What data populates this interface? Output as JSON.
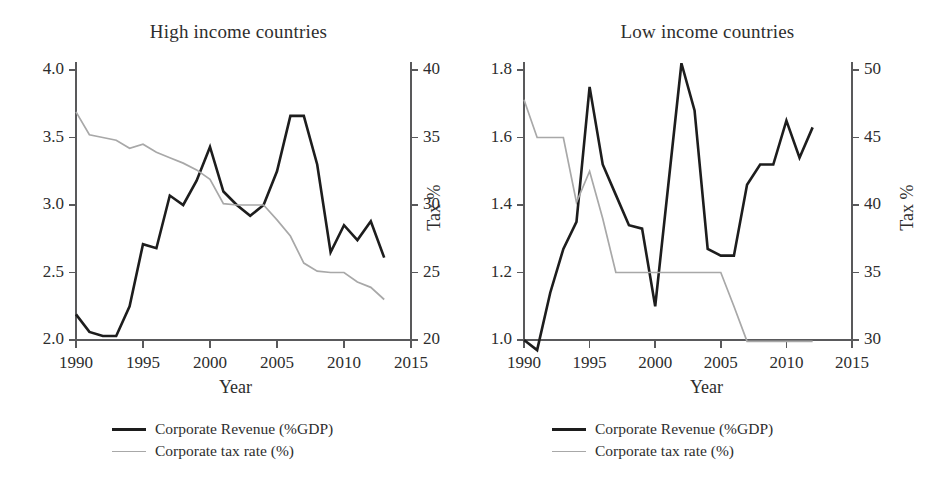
{
  "figure": {
    "panel_count": 2,
    "background_color": "#ffffff",
    "revenue_color": "#1d1d1d",
    "tax_color": "#a8a8a8",
    "axis_color": "#59595b"
  },
  "legend": {
    "revenue_label": "Corporate Revenue (%GDP)",
    "tax_label": "Corporate tax rate (%)"
  },
  "labels": {
    "xlabel": "Year",
    "ylabel_right": "Tax %"
  },
  "chart_data": [
    {
      "type": "line",
      "title": "High income countries",
      "xlabel": "Year",
      "ylabel": "",
      "ylabel_secondary": "Tax %",
      "grid": false,
      "legend_position": "below",
      "xlim": [
        1990,
        2015
      ],
      "xticks": [
        1990,
        1995,
        2000,
        2005,
        2010,
        2015
      ],
      "xtick_labels": [
        "1990",
        "1995",
        "2000",
        "2005",
        "2010",
        "2015"
      ],
      "ylim": [
        2.0,
        4.0
      ],
      "yticks": [
        2.0,
        2.5,
        3.0,
        3.5,
        4.0
      ],
      "ytick_labels": [
        "2.0",
        "2.5",
        "3.0",
        "3.5",
        "4.0"
      ],
      "ylim_secondary": [
        20,
        40
      ],
      "yticks_secondary": [
        20,
        25,
        30,
        35,
        40
      ],
      "ytick_labels_secondary": [
        "20",
        "25",
        "30",
        "35",
        "40"
      ],
      "series": [
        {
          "name": "Corporate Revenue (%GDP)",
          "axis": "left",
          "color": "#1d1d1d",
          "x": [
            1990,
            1991,
            1992,
            1993,
            1994,
            1995,
            1996,
            1997,
            1998,
            1999,
            2000,
            2001,
            2002,
            2003,
            2004,
            2005,
            2006,
            2007,
            2008,
            2009,
            2010,
            2011,
            2012,
            2013
          ],
          "values": [
            2.19,
            2.06,
            2.03,
            2.03,
            2.25,
            2.71,
            2.68,
            3.07,
            3.0,
            3.18,
            3.43,
            3.1,
            3.0,
            2.92,
            3.0,
            3.25,
            3.66,
            3.66,
            3.3,
            2.65,
            2.85,
            2.74,
            2.88,
            2.61
          ]
        },
        {
          "name": "Corporate tax rate (%)",
          "axis": "right",
          "color": "#a8a8a8",
          "x": [
            1990,
            1991,
            1992,
            1993,
            1994,
            1995,
            1996,
            1997,
            1998,
            1999,
            2000,
            2001,
            2002,
            2003,
            2004,
            2005,
            2006,
            2007,
            2008,
            2009,
            2010,
            2011,
            2012,
            2013
          ],
          "values": [
            36.9,
            35.2,
            35.0,
            34.8,
            34.2,
            34.5,
            33.9,
            33.5,
            33.1,
            32.6,
            31.9,
            30.1,
            30.0,
            30.0,
            30.0,
            28.9,
            27.7,
            25.7,
            25.1,
            25.0,
            25.0,
            24.3,
            23.9,
            23.0
          ]
        }
      ]
    },
    {
      "type": "line",
      "title": "Low income countries",
      "xlabel": "Year",
      "ylabel": "",
      "ylabel_secondary": "Tax %",
      "grid": false,
      "legend_position": "below",
      "xlim": [
        1990,
        2015
      ],
      "xticks": [
        1990,
        1995,
        2000,
        2005,
        2010,
        2015
      ],
      "xtick_labels": [
        "1990",
        "1995",
        "2000",
        "2005",
        "2010",
        "2015"
      ],
      "ylim": [
        1.0,
        1.8
      ],
      "yticks": [
        1.0,
        1.2,
        1.4,
        1.6,
        1.8
      ],
      "ytick_labels": [
        "1.0",
        "1.2",
        "1.4",
        "1.6",
        "1.8"
      ],
      "ylim_secondary": [
        30,
        50
      ],
      "yticks_secondary": [
        30,
        35,
        40,
        45,
        50
      ],
      "ytick_labels_secondary": [
        "30",
        "35",
        "40",
        "45",
        "50"
      ],
      "series": [
        {
          "name": "Corporate Revenue (%GDP)",
          "axis": "left",
          "color": "#1d1d1d",
          "x": [
            1990,
            1991,
            1992,
            1993,
            1994,
            1995,
            1996,
            1997,
            1998,
            1999,
            2000,
            2001,
            2002,
            2003,
            2004,
            2005,
            2006,
            2007,
            2008,
            2009,
            2010,
            2011,
            2012
          ],
          "values": [
            1.0,
            0.97,
            1.14,
            1.27,
            1.35,
            1.75,
            1.52,
            1.43,
            1.34,
            1.33,
            1.1,
            1.46,
            1.82,
            1.68,
            1.27,
            1.25,
            1.25,
            1.46,
            1.52,
            1.52,
            1.65,
            1.54,
            1.63
          ]
        },
        {
          "name": "Corporate tax rate (%)",
          "axis": "right",
          "color": "#a8a8a8",
          "x": [
            1990,
            1991,
            1992,
            1993,
            1994,
            1995,
            1996,
            1997,
            1998,
            1999,
            2000,
            2001,
            2002,
            2003,
            2004,
            2005,
            2006,
            2007,
            2008,
            2009,
            2010,
            2011,
            2012
          ],
          "values": [
            47.8,
            45.0,
            45.0,
            45.0,
            40.2,
            42.5,
            39.0,
            35.0,
            35.0,
            35.0,
            35.0,
            35.0,
            35.0,
            35.0,
            35.0,
            35.0,
            32.5,
            29.9,
            29.9,
            29.9,
            29.9,
            29.9,
            29.9
          ]
        }
      ]
    }
  ]
}
